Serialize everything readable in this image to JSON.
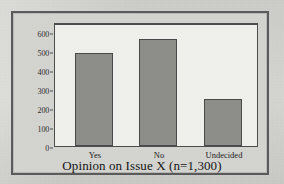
{
  "chart_data": {
    "type": "bar",
    "title": "",
    "subtitle": "",
    "categories": [
      "Yes",
      "No",
      "Undecided"
    ],
    "values": [
      500,
      575,
      250
    ],
    "xlabel": "Opinion on Issue X (n=1,300)",
    "ylabel": "Frequency",
    "ylim": [
      0,
      650
    ],
    "yticks": [
      0,
      100,
      200,
      300,
      400,
      500,
      600
    ],
    "ytick_labels": [
      "0",
      "100",
      "200",
      "300",
      "400",
      "500",
      "600"
    ],
    "grid": false,
    "legend": null,
    "bar_color": "#8d8d8a",
    "bar_edge_color": "#4a4a4a",
    "panel_background": "#efefec",
    "figure_background": "#d3d3cf",
    "axis_color": "#4d4d4d",
    "sample_size": "n=1,300"
  }
}
